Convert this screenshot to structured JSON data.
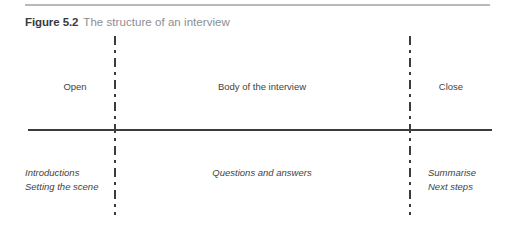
{
  "figure": {
    "number": "Figure 5.2",
    "title": "The structure of an interview",
    "colors": {
      "top_rule": "#b9b9bc",
      "axis": "#3c3c3e",
      "divider": "#3c3c3e",
      "caption_number": "#3a3a3c",
      "caption_title": "#8d8d92",
      "label_text": "#3f3f41",
      "background": "#ffffff"
    }
  },
  "diagram": {
    "phases": [
      {
        "id": "open",
        "label": "Open"
      },
      {
        "id": "body",
        "label": "Body of the interview"
      },
      {
        "id": "close",
        "label": "Close"
      }
    ],
    "activities": {
      "open": {
        "line1": "Introductions",
        "line2": "Setting the scene"
      },
      "body": {
        "line1": "Questions and answers"
      },
      "close": {
        "line1": "Summarise",
        "line2": "Next steps"
      }
    }
  }
}
